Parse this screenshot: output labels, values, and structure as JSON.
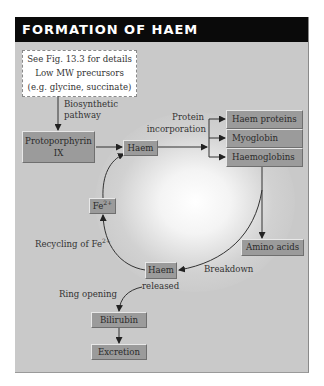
{
  "header": {
    "title": "FORMATION OF HAEM"
  },
  "note": {
    "lines": [
      "See Fig. 13.3 for details",
      "Low MW precursors",
      "(e.g. glycine, succinate)"
    ]
  },
  "nodes": {
    "protoporphyrin": {
      "line1": "Protoporphyrin",
      "line2": "IX"
    },
    "haem_top": "Haem",
    "haem_proteins": "Haem proteins",
    "myoglobin": "Myoglobin",
    "haemoglobins": "Haemoglobins",
    "fe": {
      "base": "Fe",
      "sup": "2+"
    },
    "amino_acids": "Amino acids",
    "haem_released": "Haem",
    "bilirubin": "Bilirubin",
    "excretion": "Excretion"
  },
  "labels": {
    "biosynthetic": [
      "Biosynthetic",
      "pathway"
    ],
    "protein_incorporation": [
      "Protein",
      "incorporation"
    ],
    "recycling": {
      "text": "Recycling of Fe",
      "sup": "2+"
    },
    "breakdown": "Breakdown",
    "released": "released",
    "ring_opening": "Ring opening"
  },
  "colors": {
    "panel": "#c9c9c9",
    "header": "#0a0a0a",
    "box": "#9b9b9b",
    "line": "#333333"
  }
}
